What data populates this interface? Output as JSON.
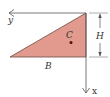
{
  "diagram": {
    "type": "right-triangle-area-centroid",
    "shape": {
      "name": "right triangle",
      "fill_color": "#e39a8e",
      "stroke_color": "#555555"
    },
    "labels": {
      "y_axis": "y",
      "x_axis": "x",
      "centroid": "C",
      "base": "B",
      "height": "H"
    },
    "colors": {
      "axis": "#555555",
      "centroid_dot": "#4a1010",
      "text": "#333333",
      "background": "#ffffff"
    }
  }
}
